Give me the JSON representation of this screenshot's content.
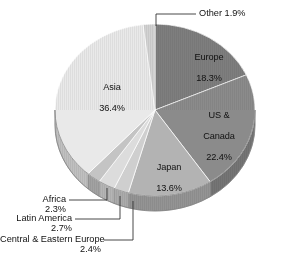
{
  "chart_data": {
    "type": "pie",
    "title": "",
    "subtitle": "",
    "xlabel": "",
    "ylabel": "",
    "legend_position": "none",
    "grid": false,
    "units": "percent",
    "labels": [
      "Europe",
      "US & Canada",
      "Japan",
      "Central & Eastern Europe",
      "Latin America",
      "Africa",
      "Asia",
      "Other"
    ],
    "values": [
      18.3,
      22.4,
      13.6,
      2.4,
      2.7,
      2.3,
      36.4,
      1.9
    ],
    "slices": [
      {
        "name": "Europe",
        "value": 18.3,
        "value_text": "18.3%",
        "label_text": "Europe\n18.3%",
        "color": "#7e7e7e",
        "side_color": "#6b6b6b",
        "label_placement": "inside"
      },
      {
        "name": "US & Canada",
        "value": 22.4,
        "value_text": "22.4%",
        "label_text": "US &\nCanada\n22.4%",
        "color": "#8b8b8b",
        "side_color": "#757575",
        "label_placement": "inside"
      },
      {
        "name": "Japan",
        "value": 13.6,
        "value_text": "13.6%",
        "label_text": "Japan\n13.6%",
        "color": "#b3b3b3",
        "side_color": "#949494",
        "label_placement": "inside"
      },
      {
        "name": "Central & Eastern Europe",
        "value": 2.4,
        "value_text": "2.4%",
        "label_text": "Central & Eastern Europe",
        "color": "#cfcfcf",
        "side_color": "#ababab",
        "label_placement": "callout"
      },
      {
        "name": "Latin America",
        "value": 2.7,
        "value_text": "2.7%",
        "label_text": "Latin America",
        "color": "#dcdcdc",
        "side_color": "#b5b5b5",
        "label_placement": "callout"
      },
      {
        "name": "Africa",
        "value": 2.3,
        "value_text": "2.3%",
        "label_text": "Africa",
        "color": "#c4c4c4",
        "side_color": "#a2a2a2",
        "label_placement": "callout"
      },
      {
        "name": "Asia",
        "value": 36.4,
        "value_text": "36.4%",
        "label_text": "Asia\n36.4%",
        "color": "#e9e9e9",
        "side_color": "#c0c0c0",
        "label_placement": "inside"
      },
      {
        "name": "Other",
        "value": 1.9,
        "value_text": "1.9%",
        "label_text": "Other 1.9%",
        "color": "#d2d2d2",
        "side_color": "#aeaeae",
        "label_placement": "callout"
      }
    ]
  },
  "labels": {
    "europe": {
      "name": "Europe",
      "pct": "18.3%"
    },
    "us": {
      "line1": "US &",
      "line2": "Canada",
      "pct": "22.4%"
    },
    "japan": {
      "name": "Japan",
      "pct": "13.6%"
    },
    "asia": {
      "name": "Asia",
      "pct": "36.4%"
    },
    "other": {
      "text": "Other 1.9%"
    },
    "africa": {
      "name": "Africa",
      "pct": "2.3%"
    },
    "latin": {
      "name": "Latin America",
      "pct": "2.7%"
    },
    "cee": {
      "name": "Central & Eastern Europe",
      "pct": "2.4%"
    }
  },
  "colors": {
    "background": "#ffffff",
    "text": "#111111",
    "leader_line": "#333333"
  }
}
